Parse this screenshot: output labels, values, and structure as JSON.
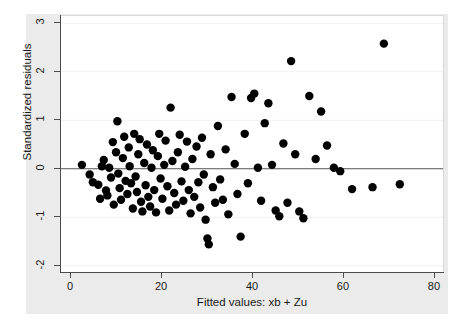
{
  "chart_data": {
    "type": "scatter",
    "title": "",
    "xlabel": "Fitted values: xb + Zu",
    "ylabel": "Standardized residuals",
    "xlim": [
      -2,
      82
    ],
    "ylim": [
      -2.15,
      3.15
    ],
    "xticks": [
      0,
      20,
      40,
      60,
      80
    ],
    "yticks": [
      -2,
      -1,
      0,
      1,
      2,
      3
    ],
    "xtick_labels": [
      "0",
      "20",
      "40",
      "60",
      "80"
    ],
    "ytick_labels": [
      "-2",
      "-1",
      "0",
      "1",
      "2",
      "3"
    ],
    "grid": "horizontal-light",
    "legend": "none",
    "reference_line": {
      "orientation": "horizontal",
      "y": 0
    },
    "marker": {
      "shape": "circle",
      "color": "#000000",
      "size": 4.2
    },
    "points": [
      {
        "x": 2.6,
        "y": 0.08
      },
      {
        "x": 4.3,
        "y": -0.12
      },
      {
        "x": 5.0,
        "y": -0.28
      },
      {
        "x": 6.2,
        "y": -0.33
      },
      {
        "x": 6.6,
        "y": -0.62
      },
      {
        "x": 7.0,
        "y": 0.05
      },
      {
        "x": 7.4,
        "y": 0.18
      },
      {
        "x": 7.9,
        "y": -0.45
      },
      {
        "x": 8.2,
        "y": -0.55
      },
      {
        "x": 8.6,
        "y": 0.02
      },
      {
        "x": 9.0,
        "y": -0.18
      },
      {
        "x": 9.4,
        "y": 0.55
      },
      {
        "x": 9.6,
        "y": -0.74
      },
      {
        "x": 10.1,
        "y": 0.34
      },
      {
        "x": 10.4,
        "y": 0.98
      },
      {
        "x": 10.6,
        "y": -0.1
      },
      {
        "x": 10.9,
        "y": -0.4
      },
      {
        "x": 11.2,
        "y": -0.64
      },
      {
        "x": 11.6,
        "y": 0.22
      },
      {
        "x": 11.9,
        "y": 0.66
      },
      {
        "x": 12.2,
        "y": -0.25
      },
      {
        "x": 12.6,
        "y": -0.52
      },
      {
        "x": 12.9,
        "y": 0.44
      },
      {
        "x": 13.1,
        "y": 0.05
      },
      {
        "x": 13.4,
        "y": -0.3
      },
      {
        "x": 13.8,
        "y": -0.82
      },
      {
        "x": 14.1,
        "y": 0.72
      },
      {
        "x": 14.4,
        "y": -0.16
      },
      {
        "x": 14.7,
        "y": -0.48
      },
      {
        "x": 15.0,
        "y": 0.3
      },
      {
        "x": 15.3,
        "y": 0.61
      },
      {
        "x": 15.6,
        "y": -0.68
      },
      {
        "x": 15.9,
        "y": -0.88
      },
      {
        "x": 16.3,
        "y": 0.12
      },
      {
        "x": 16.6,
        "y": -0.34
      },
      {
        "x": 16.9,
        "y": 0.5
      },
      {
        "x": 17.2,
        "y": -0.58
      },
      {
        "x": 17.6,
        "y": -0.78
      },
      {
        "x": 17.9,
        "y": 0.02
      },
      {
        "x": 18.2,
        "y": 0.38
      },
      {
        "x": 18.5,
        "y": -0.44
      },
      {
        "x": 18.9,
        "y": -0.9
      },
      {
        "x": 19.3,
        "y": 0.26
      },
      {
        "x": 19.6,
        "y": 0.72
      },
      {
        "x": 19.9,
        "y": -0.2
      },
      {
        "x": 20.3,
        "y": -0.62
      },
      {
        "x": 20.7,
        "y": 0.08
      },
      {
        "x": 21.0,
        "y": 0.58
      },
      {
        "x": 21.4,
        "y": -0.36
      },
      {
        "x": 21.8,
        "y": -0.86
      },
      {
        "x": 22.1,
        "y": 1.26
      },
      {
        "x": 22.5,
        "y": 0.16
      },
      {
        "x": 22.9,
        "y": -0.5
      },
      {
        "x": 23.3,
        "y": -0.74
      },
      {
        "x": 23.7,
        "y": 0.34
      },
      {
        "x": 24.1,
        "y": 0.7
      },
      {
        "x": 24.5,
        "y": -0.26
      },
      {
        "x": 24.9,
        "y": -0.66
      },
      {
        "x": 25.3,
        "y": 0.04
      },
      {
        "x": 25.7,
        "y": 0.56
      },
      {
        "x": 26.1,
        "y": -0.44
      },
      {
        "x": 26.5,
        "y": -0.92
      },
      {
        "x": 26.9,
        "y": 0.2
      },
      {
        "x": 27.3,
        "y": -0.58
      },
      {
        "x": 27.8,
        "y": 0.46
      },
      {
        "x": 28.2,
        "y": -0.28
      },
      {
        "x": 28.6,
        "y": -0.8
      },
      {
        "x": 29.0,
        "y": 0.64
      },
      {
        "x": 29.4,
        "y": -0.12
      },
      {
        "x": 29.8,
        "y": -1.05
      },
      {
        "x": 30.2,
        "y": -1.44
      },
      {
        "x": 30.5,
        "y": -1.56
      },
      {
        "x": 30.9,
        "y": 0.3
      },
      {
        "x": 31.4,
        "y": -0.38
      },
      {
        "x": 31.9,
        "y": -0.7
      },
      {
        "x": 32.5,
        "y": 0.88
      },
      {
        "x": 33.0,
        "y": -0.22
      },
      {
        "x": 33.6,
        "y": -0.64
      },
      {
        "x": 34.2,
        "y": 0.4
      },
      {
        "x": 34.8,
        "y": -0.94
      },
      {
        "x": 35.5,
        "y": 1.48
      },
      {
        "x": 36.2,
        "y": 0.1
      },
      {
        "x": 36.8,
        "y": -0.52
      },
      {
        "x": 37.5,
        "y": -1.4
      },
      {
        "x": 38.4,
        "y": 0.72
      },
      {
        "x": 39.1,
        "y": -0.3
      },
      {
        "x": 39.8,
        "y": 1.46
      },
      {
        "x": 40.5,
        "y": 1.55
      },
      {
        "x": 41.3,
        "y": 0.02
      },
      {
        "x": 42.0,
        "y": -0.66
      },
      {
        "x": 42.8,
        "y": 0.94
      },
      {
        "x": 43.6,
        "y": 1.35
      },
      {
        "x": 44.4,
        "y": 0.08
      },
      {
        "x": 45.2,
        "y": -0.86
      },
      {
        "x": 46.0,
        "y": -0.98
      },
      {
        "x": 46.9,
        "y": 0.52
      },
      {
        "x": 47.8,
        "y": -0.7
      },
      {
        "x": 48.6,
        "y": 2.22
      },
      {
        "x": 49.5,
        "y": 0.3
      },
      {
        "x": 50.4,
        "y": -0.88
      },
      {
        "x": 51.3,
        "y": -1.02
      },
      {
        "x": 52.6,
        "y": 1.5
      },
      {
        "x": 54.0,
        "y": 0.2
      },
      {
        "x": 55.2,
        "y": 1.18
      },
      {
        "x": 56.5,
        "y": 0.48
      },
      {
        "x": 58.0,
        "y": 0.02
      },
      {
        "x": 59.4,
        "y": -0.05
      },
      {
        "x": 62.0,
        "y": -0.42
      },
      {
        "x": 66.5,
        "y": -0.38
      },
      {
        "x": 69.0,
        "y": 2.58
      },
      {
        "x": 72.5,
        "y": -0.32
      }
    ]
  }
}
